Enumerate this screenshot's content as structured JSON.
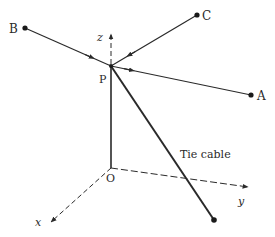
{
  "figure": {
    "width": 275,
    "height": 237,
    "colors": {
      "line": "#2a2a2a",
      "background": "#ffffff"
    },
    "points": {
      "A": {
        "label": "A",
        "x": 251,
        "y": 95
      },
      "B": {
        "label": "B",
        "x": 25,
        "y": 28
      },
      "C": {
        "label": "C",
        "x": 197,
        "y": 15
      },
      "P": {
        "label": "P",
        "x": 111,
        "y": 66
      },
      "O": {
        "label": "O",
        "x": 111,
        "y": 168
      },
      "cable_end": {
        "label": "",
        "x": 214,
        "y": 220
      }
    },
    "axes": {
      "x": {
        "label": "x"
      },
      "y": {
        "label": "y"
      },
      "z": {
        "label": "z"
      }
    },
    "annotations": {
      "tie_cable": "Tie cable"
    },
    "members": [
      {
        "from": "P",
        "to": "A",
        "arrow_direction": "toward A"
      },
      {
        "from": "P",
        "to": "B",
        "arrow_direction": "toward P"
      },
      {
        "from": "P",
        "to": "C",
        "arrow_direction": "toward P"
      },
      {
        "from": "P",
        "to": "O",
        "type": "vertical post"
      },
      {
        "from": "P",
        "to": "cable_end",
        "type": "tie cable"
      }
    ]
  }
}
